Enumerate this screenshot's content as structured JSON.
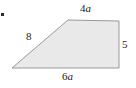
{
  "figure": {
    "kind": "geometry-diagram",
    "shape": "trapezoid",
    "background_color": "#ffffff",
    "fill_color": "#e9e9e9",
    "stroke_color": "#999999",
    "stroke_width": 1,
    "vertices": [
      {
        "name": "bottom-left",
        "x": 12,
        "y": 68
      },
      {
        "name": "top-left",
        "x": 68,
        "y": 20
      },
      {
        "name": "top-right",
        "x": 119,
        "y": 21
      },
      {
        "name": "bottom-right",
        "x": 119,
        "y": 68
      }
    ],
    "polygon_points": "12,68 68,20 119,21 119,68",
    "bullet_marker": {
      "visible": true,
      "color": "#2b2b2b"
    },
    "labels": {
      "top": {
        "coefficient": "4",
        "variable": "a",
        "text": "4a",
        "side": "top"
      },
      "right": {
        "coefficient": "5",
        "variable": "",
        "text": "5",
        "side": "right"
      },
      "bottom": {
        "coefficient": "6",
        "variable": "a",
        "text": "6a",
        "side": "bottom"
      },
      "slant": {
        "coefficient": "8",
        "variable": "",
        "text": "8",
        "side": "left-slant"
      }
    }
  }
}
